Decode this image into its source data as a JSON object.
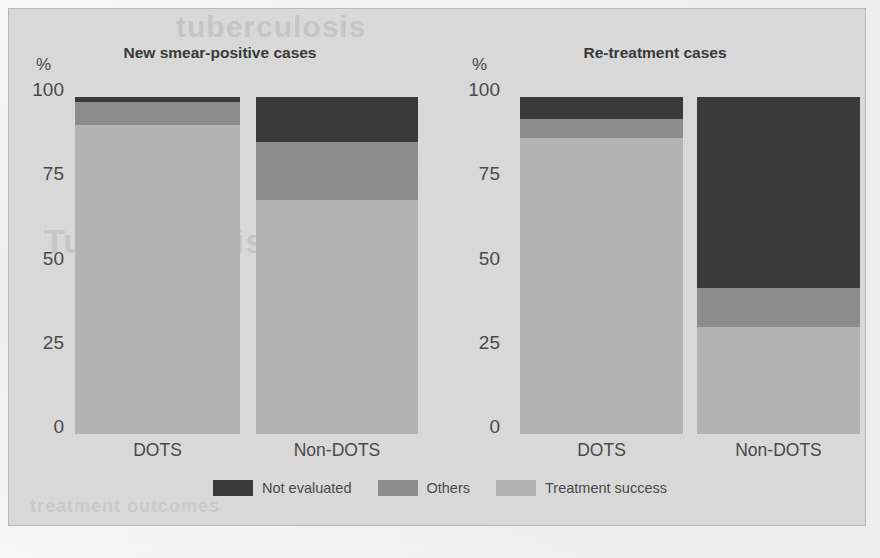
{
  "chart_data": {
    "type": "bar",
    "subtype": "stacked-bar-100",
    "title": "",
    "panels": [
      {
        "title": "New smear-positive cases",
        "ylabel": "%",
        "ylim": [
          0,
          100
        ],
        "yticks": [
          "0",
          "25",
          "50",
          "75",
          "100"
        ],
        "categories": [
          "DOTS",
          "Non-DOTS"
        ],
        "series": [
          {
            "name": "Treatment success",
            "values": [
              91.7,
              69.4
            ],
            "color": "#b4b4b4"
          },
          {
            "name": "Others",
            "values": [
              6.8,
              17.2
            ],
            "color": "#8d8d8d"
          },
          {
            "name": "Not evaluated",
            "values": [
              1.5,
              13.4
            ],
            "color": "#3a3a3a"
          }
        ]
      },
      {
        "title": "Re-treatment cases",
        "ylabel": "%",
        "ylim": [
          0,
          100
        ],
        "yticks": [
          "0",
          "25",
          "50",
          "75",
          "100"
        ],
        "categories": [
          "DOTS",
          "Non-DOTS"
        ],
        "series": [
          {
            "name": "Treatment success",
            "values": [
              87.8,
              31.8
            ],
            "color": "#b4b4b4"
          },
          {
            "name": "Others",
            "values": [
              5.6,
              11.5
            ],
            "color": "#8d8d8d"
          },
          {
            "name": "Not evaluated",
            "values": [
              6.6,
              56.7
            ],
            "color": "#3a3a3a"
          }
        ]
      }
    ],
    "legend": {
      "position": "bottom-center",
      "entries": [
        {
          "label": "Not evaluated",
          "color": "#3a3a3a"
        },
        {
          "label": "Others",
          "color": "#8d8d8d"
        },
        {
          "label": "Treatment success",
          "color": "#b4b4b4"
        }
      ]
    },
    "grid": false,
    "axis_label_y": "%"
  },
  "panel_left": {
    "title": "New smear-positive cases",
    "axis_unit": "%",
    "ticks": {
      "t100": "100",
      "t75": "75",
      "t50": "50",
      "t25": "25",
      "t0": "0"
    },
    "cat_1": "DOTS",
    "cat_2": "Non-DOTS"
  },
  "panel_right": {
    "title": "Re-treatment cases",
    "axis_unit": "%",
    "ticks": {
      "t100": "100",
      "t75": "75",
      "t50": "50",
      "t25": "25",
      "t0": "0"
    },
    "cat_1": "DOTS",
    "cat_2": "Non-DOTS"
  },
  "legend": {
    "item_1": "Not evaluated",
    "item_2": "Others",
    "item_3": "Treatment success"
  },
  "colors": {
    "not_evaluated": "#3a3a3a",
    "others": "#8d8d8d",
    "treatment_success": "#b4b4b4",
    "panel_background": "#d9d9d9",
    "page_background": "#efeff0",
    "text": "#4a4a4a"
  },
  "ghost_text": {
    "line_1": "tuberculosis",
    "line_2": "Tuberculosis",
    "line_3": "treatment outcomes"
  }
}
